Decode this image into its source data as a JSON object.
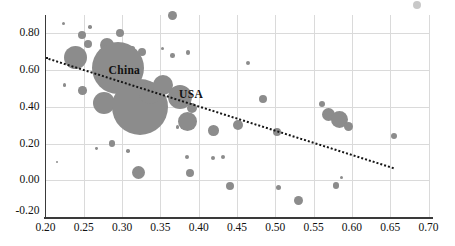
{
  "chart_data": {
    "type": "scatter",
    "subtype": "bubble",
    "title": "",
    "xlabel": "",
    "ylabel": "",
    "xlim": [
      0.2,
      0.7
    ],
    "ylim": [
      -0.2,
      0.9
    ],
    "x_tick_values": [
      0.2,
      0.25,
      0.3,
      0.35,
      0.4,
      0.45,
      0.5,
      0.55,
      0.6,
      0.65,
      0.7
    ],
    "x_tick_labels": [
      "0.20",
      "0.25",
      "0.30",
      "0.35",
      "0.40",
      "0.45",
      "0.50",
      "0.55",
      "0.60",
      "0.65",
      "0.70"
    ],
    "y_tick_values": [
      -0.2,
      0.0,
      0.2,
      0.4,
      0.6,
      0.8
    ],
    "y_tick_labels": [
      "-0.20",
      "0.00",
      "0.20",
      "0.40",
      "0.60",
      "0.80"
    ],
    "grid": true,
    "legend": "none",
    "colors": {
      "bubble": "#8c8c8c",
      "grid": "#dadada",
      "axis": "#3a3a3a",
      "trend": "#151515",
      "text": "#111111",
      "artifact": "#b5b5b5"
    },
    "annotations": [
      {
        "text": "China",
        "x": 0.303,
        "y": 0.6
      },
      {
        "text": "USA",
        "x": 0.39,
        "y": 0.47
      }
    ],
    "trendline": {
      "style": "dotted",
      "x1": 0.2,
      "y1": 0.665,
      "x2": 0.654,
      "y2": 0.065
    },
    "points": [
      {
        "x": 0.223,
        "y": 0.855,
        "r_px": 1.6
      },
      {
        "x": 0.258,
        "y": 0.835,
        "r_px": 1.8
      },
      {
        "x": 0.248,
        "y": 0.79,
        "r_px": 4.0
      },
      {
        "x": 0.255,
        "y": 0.74,
        "r_px": 4.0
      },
      {
        "x": 0.28,
        "y": 0.738,
        "r_px": 7.0
      },
      {
        "x": 0.297,
        "y": 0.8,
        "r_px": 4.0
      },
      {
        "x": 0.313,
        "y": 0.718,
        "r_px": 2.7
      },
      {
        "x": 0.326,
        "y": 0.7,
        "r_px": 4.0
      },
      {
        "x": 0.353,
        "y": 0.718,
        "r_px": 1.8
      },
      {
        "x": 0.366,
        "y": 0.68,
        "r_px": 2.3
      },
      {
        "x": 0.386,
        "y": 0.695,
        "r_px": 2.3
      },
      {
        "x": 0.366,
        "y": 0.895,
        "r_px": 4.5
      },
      {
        "x": 0.464,
        "y": 0.64,
        "r_px": 2.0
      },
      {
        "x": 0.239,
        "y": 0.67,
        "r_px": 11.5
      },
      {
        "x": 0.225,
        "y": 0.52,
        "r_px": 1.8
      },
      {
        "x": 0.248,
        "y": 0.488,
        "r_px": 4.3
      },
      {
        "x": 0.295,
        "y": 0.61,
        "r_px": 26.0,
        "label": "China"
      },
      {
        "x": 0.276,
        "y": 0.42,
        "r_px": 11.0
      },
      {
        "x": 0.323,
        "y": 0.398,
        "r_px": 28.0
      },
      {
        "x": 0.336,
        "y": 0.475,
        "r_px": 11.0
      },
      {
        "x": 0.353,
        "y": 0.52,
        "r_px": 10.0
      },
      {
        "x": 0.376,
        "y": 0.453,
        "r_px": 12.0,
        "label": "USA"
      },
      {
        "x": 0.391,
        "y": 0.393,
        "r_px": 5.0
      },
      {
        "x": 0.385,
        "y": 0.32,
        "r_px": 9.5
      },
      {
        "x": 0.372,
        "y": 0.29,
        "r_px": 1.6
      },
      {
        "x": 0.419,
        "y": 0.272,
        "r_px": 5.3
      },
      {
        "x": 0.451,
        "y": 0.3,
        "r_px": 5.0
      },
      {
        "x": 0.484,
        "y": 0.442,
        "r_px": 4.0
      },
      {
        "x": 0.561,
        "y": 0.415,
        "r_px": 3.0
      },
      {
        "x": 0.57,
        "y": 0.36,
        "r_px": 6.5
      },
      {
        "x": 0.584,
        "y": 0.333,
        "r_px": 8.5
      },
      {
        "x": 0.596,
        "y": 0.295,
        "r_px": 4.5
      },
      {
        "x": 0.655,
        "y": 0.24,
        "r_px": 3.2
      },
      {
        "x": 0.502,
        "y": 0.265,
        "r_px": 4.0
      },
      {
        "x": 0.287,
        "y": 0.2,
        "r_px": 3.3
      },
      {
        "x": 0.267,
        "y": 0.175,
        "r_px": 1.4
      },
      {
        "x": 0.308,
        "y": 0.16,
        "r_px": 1.8
      },
      {
        "x": 0.215,
        "y": 0.1,
        "r_px": 1.4
      },
      {
        "x": 0.321,
        "y": 0.045,
        "r_px": 6.5
      },
      {
        "x": 0.389,
        "y": 0.04,
        "r_px": 4.0
      },
      {
        "x": 0.385,
        "y": 0.125,
        "r_px": 2.0
      },
      {
        "x": 0.419,
        "y": 0.12,
        "r_px": 2.0
      },
      {
        "x": 0.432,
        "y": 0.125,
        "r_px": 2.0
      },
      {
        "x": 0.441,
        "y": -0.03,
        "r_px": 4.0
      },
      {
        "x": 0.504,
        "y": -0.04,
        "r_px": 2.7
      },
      {
        "x": 0.53,
        "y": -0.11,
        "r_px": 4.7
      },
      {
        "x": 0.579,
        "y": -0.03,
        "r_px": 3.3
      },
      {
        "x": 0.586,
        "y": 0.015,
        "r_px": 1.6
      }
    ],
    "artifact_dot": {
      "x": 0.685,
      "y": 0.955,
      "r_px": 4.0
    }
  }
}
